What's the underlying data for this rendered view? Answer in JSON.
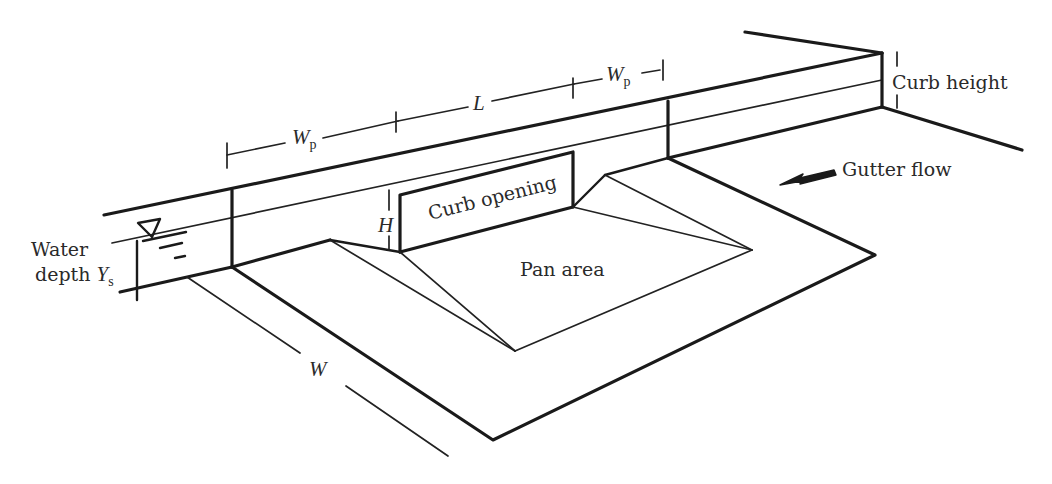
{
  "diagram": {
    "labels": {
      "water_depth_line1": "Water",
      "water_depth_line2": "depth ",
      "water_depth_symbol": "Y",
      "water_depth_subscript": "s",
      "wp_left_symbol": "W",
      "wp_left_subscript": "p",
      "length_symbol": "L",
      "wp_right_symbol": "W",
      "wp_right_subscript": "p",
      "curb_height": "Curb height",
      "gutter_flow": "Gutter flow",
      "height_symbol": "H",
      "curb_opening": "Curb opening",
      "pan_area": "Pan area",
      "width_symbol": "W"
    },
    "icons": {
      "water_surface": "inverted-triangle-water-level-icon",
      "flow_direction": "arrow-left-icon"
    },
    "colors": {
      "line": "#1a1a1a",
      "text": "#2a2a2a",
      "background": "#ffffff"
    }
  }
}
